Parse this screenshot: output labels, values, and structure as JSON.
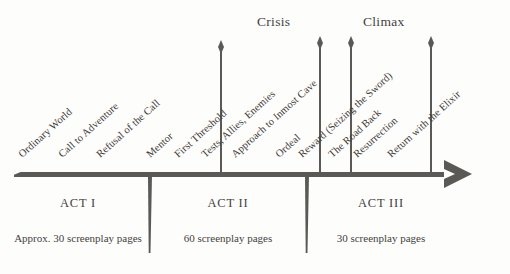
{
  "diagram": {
    "background_color": "#fdfdfb",
    "ink_color": "#5b5955",
    "peaks": [
      {
        "label": "Crisis",
        "x": 257,
        "y": 14
      },
      {
        "label": "Climax",
        "x": 363,
        "y": 14
      }
    ],
    "spears": [
      {
        "name": "crisis-spear",
        "x": 221,
        "top": 40,
        "height": 133
      },
      {
        "name": "midpoint-spear",
        "x": 320,
        "top": 36,
        "height": 137
      },
      {
        "name": "climax-spear",
        "x": 351,
        "top": 36,
        "height": 137
      },
      {
        "name": "finale-spear",
        "x": 431,
        "top": 36,
        "height": 137
      }
    ],
    "stages": [
      {
        "label": "Ordinary World",
        "x": 20,
        "y": 150
      },
      {
        "label": "Call to Adventure",
        "x": 60,
        "y": 150
      },
      {
        "label": "Refusal of the Call",
        "x": 98,
        "y": 150
      },
      {
        "label": "Mentor",
        "x": 148,
        "y": 150
      },
      {
        "label": "First Threshold",
        "x": 176,
        "y": 150
      },
      {
        "label": "Tests, Allies, Enemies",
        "x": 203,
        "y": 150
      },
      {
        "label": "Approach to Inmost Cave",
        "x": 233,
        "y": 150
      },
      {
        "label": "Ordeal",
        "x": 277,
        "y": 150
      },
      {
        "label": "Reward (Seizing the Sword)",
        "x": 300,
        "y": 150
      },
      {
        "label": "The Road Back",
        "x": 330,
        "y": 150
      },
      {
        "label": "Resurrection",
        "x": 355,
        "y": 150
      },
      {
        "label": "Return with the Elixir",
        "x": 389,
        "y": 150
      }
    ],
    "act_dividers": [
      {
        "name": "act-i-ii-divider",
        "x": 149,
        "top": 175,
        "height": 78
      },
      {
        "name": "act-ii-iii-divider",
        "x": 306,
        "top": 175,
        "height": 78
      }
    ],
    "acts": [
      {
        "name": "ACT I",
        "pages": "Approx. 30 screenplay pages",
        "name_x": 78,
        "name_y": 196,
        "pages_x": 78,
        "pages_y": 232
      },
      {
        "name": "ACT II",
        "pages": "60 screenplay pages",
        "name_x": 228,
        "name_y": 196,
        "pages_x": 228,
        "pages_y": 232
      },
      {
        "name": "ACT III",
        "pages": "30 screenplay pages",
        "name_x": 381,
        "name_y": 196,
        "pages_x": 381,
        "pages_y": 232
      }
    ]
  }
}
